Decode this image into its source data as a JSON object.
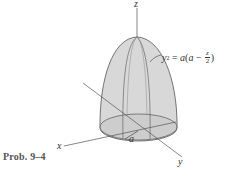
{
  "figure": {
    "caption": "Prob. 9–4",
    "axes": {
      "x_label": "x",
      "y_label": "y",
      "z_label": "z"
    },
    "radius_label": "a",
    "equation": {
      "lhs_var": "y",
      "lhs_exp": "2",
      "equals": " = ",
      "rhs_a": "a",
      "rhs_open": "(",
      "rhs_inner_a": "a",
      "rhs_minus": " − ",
      "frac_num": "z",
      "frac_den": "2",
      "rhs_close": ")"
    },
    "colors": {
      "dome_fill": "#d6d6d6",
      "base_fill": "#cfcfcf",
      "line": "#555555",
      "background": "#ffffff"
    }
  }
}
